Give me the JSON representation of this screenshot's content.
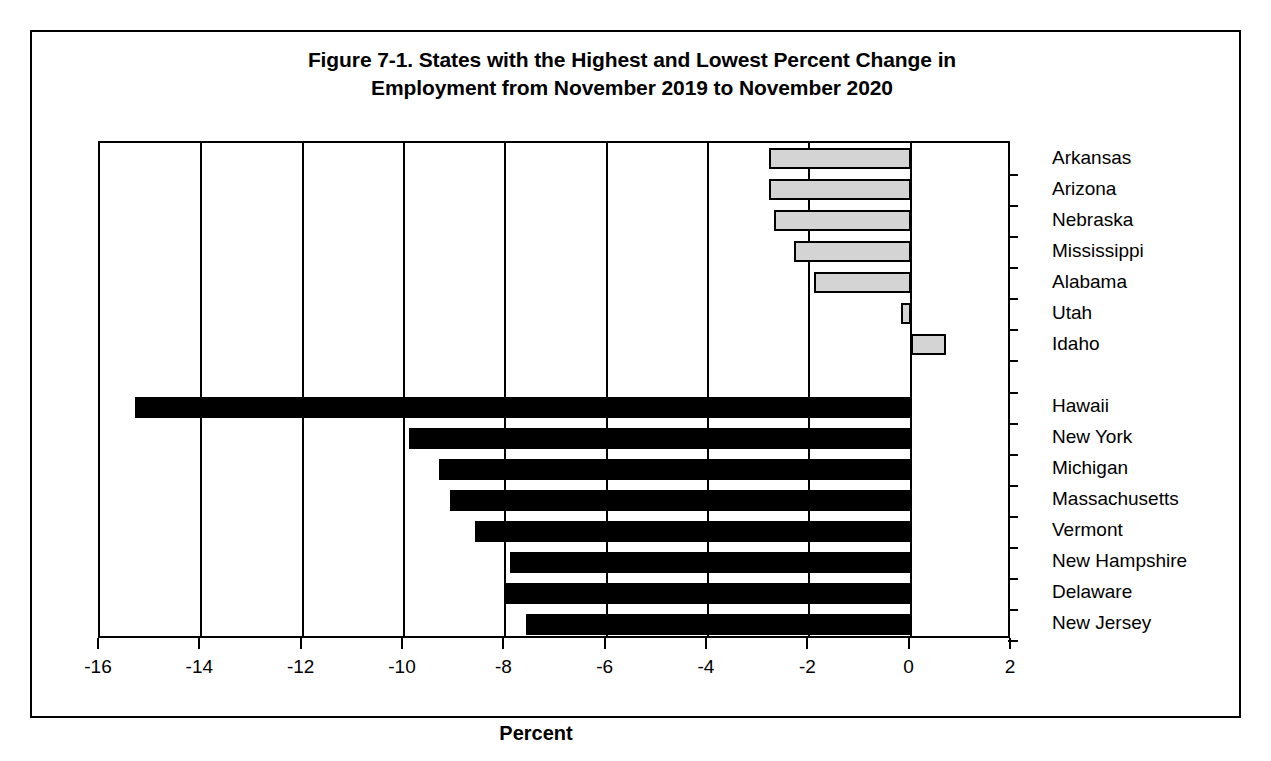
{
  "figure": {
    "title_line1": "Figure 7-1. States with the Highest and Lowest Percent Change in",
    "title_line2": "Employment from November 2019 to November 2020",
    "x_axis_title": "Percent"
  },
  "chart_data": {
    "type": "bar",
    "orientation": "horizontal",
    "title": "Figure 7-1. States with the Highest and Lowest Percent Change in Employment from November 2019 to November 2020",
    "xlabel": "Percent",
    "ylabel": "",
    "xlim": [
      -16,
      2
    ],
    "xticks": [
      -16,
      -14,
      -12,
      -10,
      -8,
      -6,
      -4,
      -2,
      0,
      2
    ],
    "xtick_labels": [
      "-16",
      "-14",
      "-12",
      "-10",
      "-8",
      "-6",
      "-4",
      "-2",
      "0",
      "2"
    ],
    "grid": "vertical gridlines at every tick",
    "legend": "none",
    "groups": [
      {
        "name": "Highest percent change",
        "style": "light-gray fill, black outline",
        "color": "#d4d4d4",
        "categories": [
          "Arkansas",
          "Arizona",
          "Nebraska",
          "Mississippi",
          "Alabama",
          "Utah",
          "Idaho"
        ],
        "values": [
          -2.8,
          -2.8,
          -2.7,
          -2.3,
          -1.9,
          -0.2,
          0.7
        ]
      },
      {
        "name": "Lowest percent change",
        "style": "solid black fill",
        "color": "#000000",
        "categories": [
          "Hawaii",
          "New York",
          "Michigan",
          "Massachusetts",
          "Vermont",
          "New Hampshire",
          "Delaware",
          "New Jersey"
        ],
        "values": [
          -15.3,
          -9.9,
          -9.3,
          -9.1,
          -8.6,
          -7.9,
          -8.0,
          -7.6
        ]
      }
    ],
    "categories": [
      "Arkansas",
      "Arizona",
      "Nebraska",
      "Mississippi",
      "Alabama",
      "Utah",
      "Idaho",
      "Hawaii",
      "New York",
      "Michigan",
      "Massachusetts",
      "Vermont",
      "New Hampshire",
      "Delaware",
      "New Jersey"
    ],
    "values": [
      -2.8,
      -2.8,
      -2.7,
      -2.3,
      -1.9,
      -0.2,
      0.7,
      -15.3,
      -9.9,
      -9.3,
      -9.1,
      -8.6,
      -7.9,
      -8.0,
      -7.6
    ]
  }
}
